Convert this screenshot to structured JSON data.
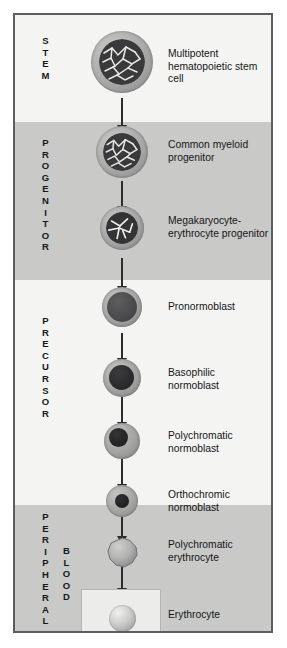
{
  "figure": {
    "colors": {
      "band_light": "#f4f4f2",
      "band_dark": "#c9c9c7",
      "frame_border": "#5a5d61",
      "arrow": "#2b2d2f",
      "text": "#141618"
    }
  },
  "phases": [
    {
      "name": "stem",
      "letters": "STEM"
    },
    {
      "name": "progenitor",
      "letters": "PROGENITOR"
    },
    {
      "name": "precursor",
      "letters": "PRECURSOR"
    },
    {
      "name": "blood",
      "letters": "PERIPHERAL",
      "letters2": "BLOOD"
    }
  ],
  "stages": [
    {
      "id": "multipotent-hematopoietic-stem-cell",
      "label": "Multipotent\nhematopoietic stem cell",
      "cell_type": "mottled-nucleus"
    },
    {
      "id": "common-myeloid-progenitor",
      "label": "Common myeloid\nprogenitor",
      "cell_type": "mottled-nucleus"
    },
    {
      "id": "megakaryocyte-erythrocyte-progenitor",
      "label": "Megakaryocyte-\nerythrocyte progenitor",
      "cell_type": "mottled-nucleus"
    },
    {
      "id": "pronormoblast",
      "label": "Pronormoblast",
      "cell_type": "large-nucleus"
    },
    {
      "id": "basophilic-normoblast",
      "label": "Basophilic\nnormoblast",
      "cell_type": "large-nucleus"
    },
    {
      "id": "polychromatic-normoblast",
      "label": "Polychromatic\nnormoblast",
      "cell_type": "medium-nucleus"
    },
    {
      "id": "orthochromic-normoblast",
      "label": "Orthochromic\nnormoblast",
      "cell_type": "small-nucleus"
    },
    {
      "id": "polychromatic-erythrocyte",
      "label": "Polychromatic\nerythrocyte",
      "cell_type": "anucleate"
    },
    {
      "id": "erythrocyte",
      "label": "Erythrocyte",
      "cell_type": "biconcave-disc"
    }
  ]
}
